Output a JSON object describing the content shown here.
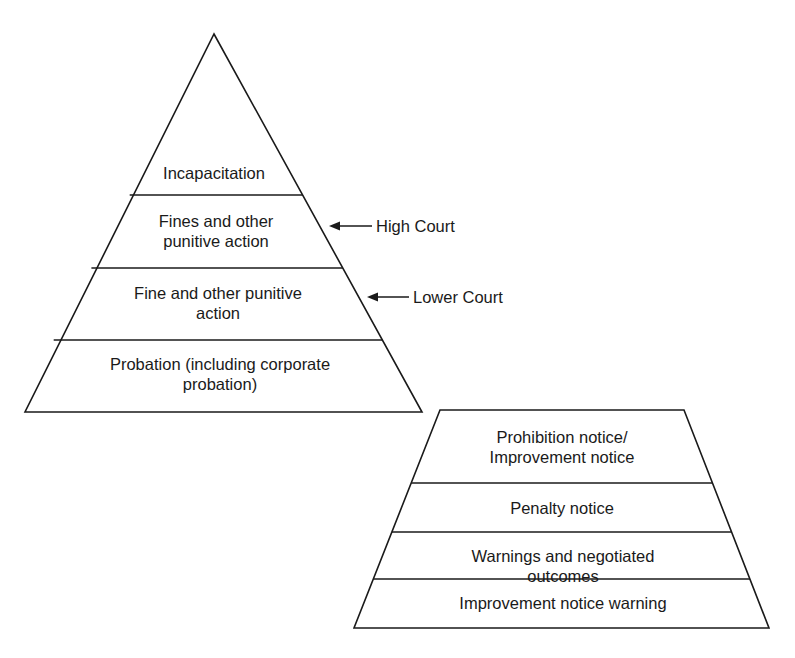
{
  "diagram": {
    "upper_pyramid": {
      "levels": [
        {
          "label": "Incapacitation"
        },
        {
          "label": "Fines and other\npunitive  action"
        },
        {
          "label": "Fine and other punitive\naction"
        },
        {
          "label": "Probation (including corporate\nprobation)"
        }
      ],
      "annotations": [
        {
          "label": "High Court",
          "points_to_level": 1
        },
        {
          "label": "Lower Court",
          "points_to_level": 2
        }
      ]
    },
    "lower_pyramid": {
      "levels": [
        {
          "label": "Prohibition notice/\nImprovement notice"
        },
        {
          "label": "Penalty notice"
        },
        {
          "label": "Warnings and negotiated outcomes"
        },
        {
          "label": "Improvement notice warning"
        }
      ]
    },
    "colors": {
      "line": "#1a1a1a",
      "background": "#ffffff"
    }
  }
}
